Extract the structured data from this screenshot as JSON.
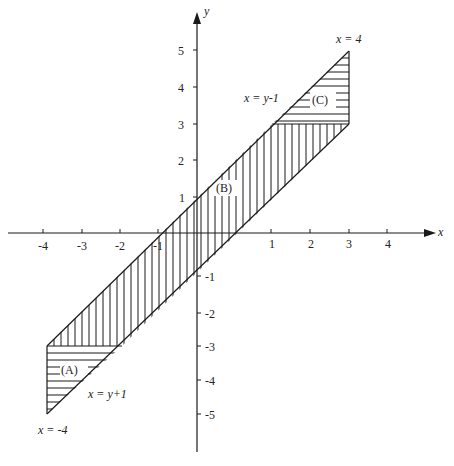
{
  "diagram": {
    "type": "region-of-integration",
    "axes": {
      "x_label": "x",
      "y_label": "y",
      "x_ticks": [
        "-4",
        "-3",
        "-2",
        "-1",
        "1",
        "2",
        "3",
        "4"
      ],
      "y_ticks_pos": [
        "5",
        "4",
        "3",
        "2",
        "1"
      ],
      "y_ticks_neg": [
        "-1",
        "-2",
        "-3",
        "-4",
        "-5"
      ]
    },
    "regions": [
      {
        "id": "A",
        "label": "(A)",
        "hatch": "horizontal"
      },
      {
        "id": "B",
        "label": "(B)",
        "hatch": "vertical"
      },
      {
        "id": "C",
        "label": "(C)",
        "hatch": "horizontal"
      }
    ],
    "curve_labels": {
      "upper_line": "x = y-1",
      "lower_line": "x = y+1",
      "right_bound": "x = 4",
      "left_bound": "x = -4"
    },
    "vertices": {
      "left_top": [
        -4,
        -3
      ],
      "left_bottom": [
        -4,
        -5
      ],
      "right_top": [
        3,
        5
      ],
      "right_bottom": [
        3,
        3
      ]
    },
    "line_color": "#1a1a1a"
  }
}
